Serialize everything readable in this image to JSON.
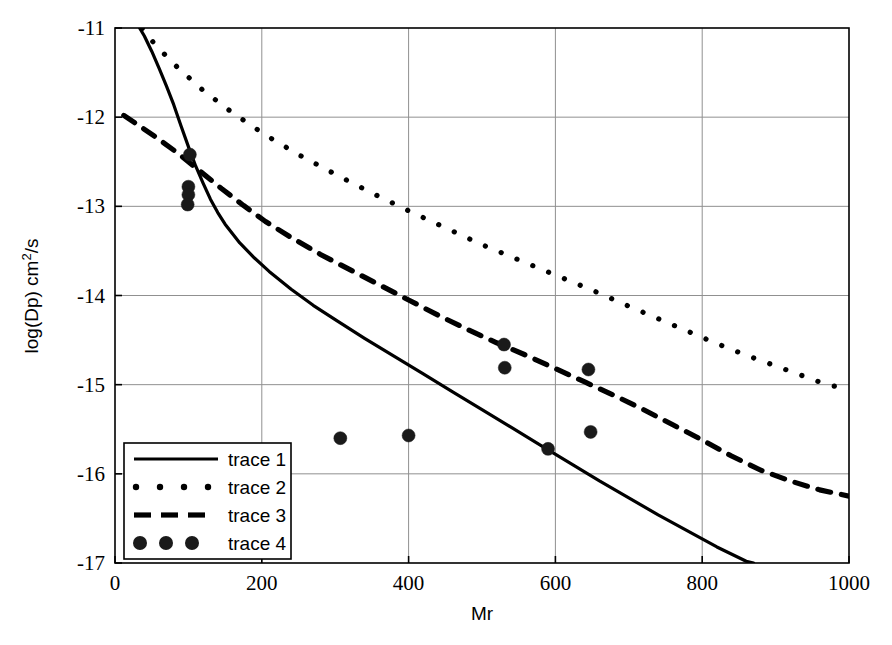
{
  "chart_data": {
    "type": "line",
    "title": "",
    "xlabel": "Mr",
    "ylabel": "log(Dp)  cm2/s",
    "ylabel_base": "log(Dp)  cm",
    "ylabel_sup": "2",
    "ylabel_tail": "/s",
    "xlim": [
      0,
      1000
    ],
    "ylim": [
      -17,
      -11
    ],
    "grid": true,
    "legend_position": "lower-left",
    "xticks": [
      0,
      200,
      400,
      600,
      800,
      1000
    ],
    "xtick_labels": [
      "0",
      "200",
      "400",
      "600",
      "800",
      "1000"
    ],
    "yticks": [
      -17,
      -16,
      -15,
      -14,
      -13,
      -12,
      -11
    ],
    "ytick_labels": [
      "-17",
      "-16",
      "-15",
      "-14",
      "-13",
      "-12",
      "-11"
    ],
    "series": [
      {
        "name": "trace 1",
        "style": "solid",
        "color": "#000000",
        "points": [
          [
            12,
            -10.62
          ],
          [
            20,
            -10.78
          ],
          [
            30,
            -10.95
          ],
          [
            40,
            -11.09
          ],
          [
            50,
            -11.26
          ],
          [
            60,
            -11.45
          ],
          [
            70,
            -11.65
          ],
          [
            80,
            -11.86
          ],
          [
            90,
            -12.1
          ],
          [
            100,
            -12.33
          ],
          [
            110,
            -12.55
          ],
          [
            120,
            -12.74
          ],
          [
            130,
            -12.92
          ],
          [
            140,
            -13.07
          ],
          [
            150,
            -13.2
          ],
          [
            170,
            -13.41
          ],
          [
            190,
            -13.58
          ],
          [
            210,
            -13.73
          ],
          [
            240,
            -13.93
          ],
          [
            270,
            -14.11
          ],
          [
            300,
            -14.27
          ],
          [
            340,
            -14.48
          ],
          [
            380,
            -14.68
          ],
          [
            420,
            -14.88
          ],
          [
            460,
            -15.08
          ],
          [
            500,
            -15.28
          ],
          [
            540,
            -15.48
          ],
          [
            580,
            -15.68
          ],
          [
            620,
            -15.88
          ],
          [
            660,
            -16.08
          ],
          [
            700,
            -16.27
          ],
          [
            740,
            -16.46
          ],
          [
            780,
            -16.64
          ],
          [
            820,
            -16.82
          ],
          [
            860,
            -16.98
          ],
          [
            870,
            -17.0
          ]
        ]
      },
      {
        "name": "trace 2",
        "style": "dotted",
        "color": "#000000",
        "points": [
          [
            12,
            -10.68
          ],
          [
            30,
            -10.93
          ],
          [
            55,
            -11.19
          ],
          [
            85,
            -11.44
          ],
          [
            120,
            -11.7
          ],
          [
            160,
            -11.95
          ],
          [
            205,
            -12.2
          ],
          [
            250,
            -12.42
          ],
          [
            300,
            -12.64
          ],
          [
            350,
            -12.85
          ],
          [
            400,
            -13.05
          ],
          [
            450,
            -13.24
          ],
          [
            500,
            -13.43
          ],
          [
            550,
            -13.6
          ],
          [
            600,
            -13.77
          ],
          [
            650,
            -13.94
          ],
          [
            700,
            -14.12
          ],
          [
            740,
            -14.26
          ],
          [
            780,
            -14.4
          ],
          [
            820,
            -14.54
          ],
          [
            860,
            -14.67
          ],
          [
            900,
            -14.79
          ],
          [
            940,
            -14.91
          ],
          [
            970,
            -15.0
          ],
          [
            1000,
            -15.05
          ]
        ]
      },
      {
        "name": "trace 3",
        "style": "dashed",
        "color": "#000000",
        "points": [
          [
            12,
            -11.98
          ],
          [
            30,
            -12.08
          ],
          [
            55,
            -12.22
          ],
          [
            85,
            -12.4
          ],
          [
            115,
            -12.6
          ],
          [
            145,
            -12.8
          ],
          [
            175,
            -12.99
          ],
          [
            205,
            -13.17
          ],
          [
            240,
            -13.35
          ],
          [
            280,
            -13.54
          ],
          [
            320,
            -13.71
          ],
          [
            360,
            -13.88
          ],
          [
            400,
            -14.05
          ],
          [
            440,
            -14.22
          ],
          [
            480,
            -14.38
          ],
          [
            520,
            -14.53
          ],
          [
            560,
            -14.67
          ],
          [
            600,
            -14.82
          ],
          [
            640,
            -14.97
          ],
          [
            680,
            -15.12
          ],
          [
            720,
            -15.28
          ],
          [
            760,
            -15.45
          ],
          [
            800,
            -15.62
          ],
          [
            840,
            -15.8
          ],
          [
            880,
            -15.96
          ],
          [
            920,
            -16.08
          ],
          [
            960,
            -16.18
          ],
          [
            1000,
            -16.25
          ]
        ]
      },
      {
        "name": "trace 4",
        "style": "markers",
        "color": "#1a1a1a",
        "marker": "filled-circle",
        "marker_size": 13,
        "points": [
          [
            102,
            -12.42
          ],
          [
            100,
            -12.78
          ],
          [
            100,
            -12.87
          ],
          [
            99,
            -12.98
          ],
          [
            307,
            -15.6
          ],
          [
            400,
            -15.57
          ],
          [
            530,
            -14.55
          ],
          [
            531,
            -14.81
          ],
          [
            590,
            -15.72
          ],
          [
            645,
            -14.83
          ],
          [
            648,
            -15.53
          ]
        ]
      }
    ]
  },
  "legend": {
    "entries": [
      {
        "label": "trace 1",
        "style": "solid"
      },
      {
        "label": "trace 2",
        "style": "dotted"
      },
      {
        "label": "trace 3",
        "style": "dashed"
      },
      {
        "label": "trace 4",
        "style": "markers"
      }
    ]
  }
}
